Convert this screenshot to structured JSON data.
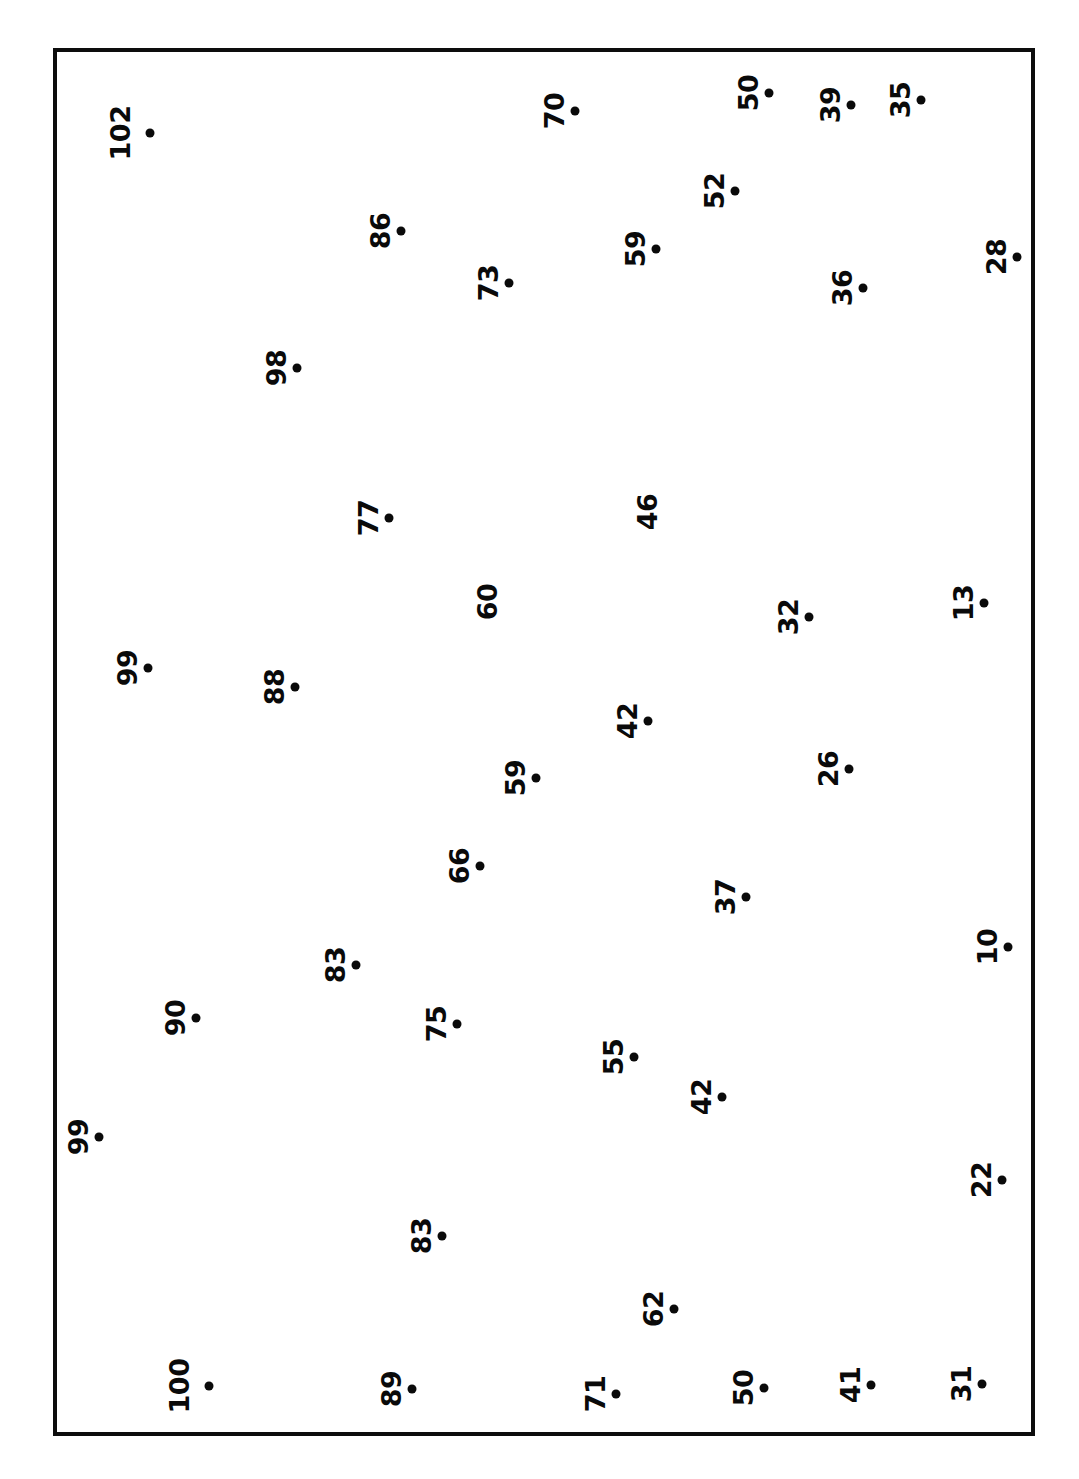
{
  "figure": {
    "kind": "scatter-plot",
    "background_color": "#ffffff",
    "frame_color": "#0d0d0d",
    "marker_color": "#0a0a0a",
    "label_color": "#0a0a0a",
    "label_rotation_deg": -90
  },
  "chart_data": {
    "type": "scatter",
    "title": "",
    "xlabel": "",
    "ylabel": "",
    "grid": false,
    "legend": null,
    "axis_ticks": [],
    "axis_tick_labels": [],
    "xlim": [
      53,
      1035
    ],
    "ylim": [
      48,
      1436
    ],
    "point_label_orientation": "rotated 90 degrees counter-clockwise, placed to the left of each marker",
    "note": "Each marker is annotated with a numeric value. Two annotations (60 and 46) appear without a visible marker dot.",
    "labels": [
      102,
      70,
      50,
      39,
      35,
      86,
      52,
      59,
      73,
      36,
      28,
      98,
      77,
      46,
      60,
      32,
      13,
      99,
      88,
      42,
      59,
      26,
      66,
      37,
      83,
      10,
      90,
      75,
      55,
      42,
      99,
      22,
      83,
      62,
      100,
      89,
      71,
      50,
      41,
      31
    ],
    "points": [
      {
        "label": "102",
        "x": 150,
        "y": 133,
        "marker": true
      },
      {
        "label": "70",
        "x": 575,
        "y": 111,
        "marker": true
      },
      {
        "label": "50",
        "x": 769,
        "y": 93,
        "marker": true
      },
      {
        "label": "39",
        "x": 851,
        "y": 105,
        "marker": true
      },
      {
        "label": "35",
        "x": 921,
        "y": 100,
        "marker": true
      },
      {
        "label": "86",
        "x": 401,
        "y": 231,
        "marker": true
      },
      {
        "label": "52",
        "x": 735,
        "y": 191,
        "marker": true
      },
      {
        "label": "59",
        "x": 656,
        "y": 249,
        "marker": true
      },
      {
        "label": "73",
        "x": 509,
        "y": 283,
        "marker": true
      },
      {
        "label": "36",
        "x": 863,
        "y": 288,
        "marker": true
      },
      {
        "label": "28",
        "x": 1017,
        "y": 257,
        "marker": true
      },
      {
        "label": "98",
        "x": 297,
        "y": 368,
        "marker": true
      },
      {
        "label": "77",
        "x": 389,
        "y": 518,
        "marker": true
      },
      {
        "label": "46",
        "x": 668,
        "y": 512,
        "marker": false
      },
      {
        "label": "60",
        "x": 508,
        "y": 602,
        "marker": false
      },
      {
        "label": "32",
        "x": 809,
        "y": 617,
        "marker": true
      },
      {
        "label": "13",
        "x": 984,
        "y": 603,
        "marker": true
      },
      {
        "label": "99",
        "x": 148,
        "y": 668,
        "marker": true
      },
      {
        "label": "88",
        "x": 295,
        "y": 687,
        "marker": true
      },
      {
        "label": "42",
        "x": 648,
        "y": 721,
        "marker": true
      },
      {
        "label": "59",
        "x": 536,
        "y": 778,
        "marker": true
      },
      {
        "label": "26",
        "x": 849,
        "y": 769,
        "marker": true
      },
      {
        "label": "66",
        "x": 480,
        "y": 866,
        "marker": true
      },
      {
        "label": "37",
        "x": 746,
        "y": 897,
        "marker": true
      },
      {
        "label": "83",
        "x": 356,
        "y": 965,
        "marker": true
      },
      {
        "label": "10",
        "x": 1008,
        "y": 947,
        "marker": true
      },
      {
        "label": "90",
        "x": 196,
        "y": 1018,
        "marker": true
      },
      {
        "label": "75",
        "x": 457,
        "y": 1024,
        "marker": true
      },
      {
        "label": "55",
        "x": 634,
        "y": 1057,
        "marker": true
      },
      {
        "label": "42",
        "x": 722,
        "y": 1097,
        "marker": true
      },
      {
        "label": "99",
        "x": 99,
        "y": 1137,
        "marker": true
      },
      {
        "label": "22",
        "x": 1002,
        "y": 1180,
        "marker": true
      },
      {
        "label": "83",
        "x": 442,
        "y": 1236,
        "marker": true
      },
      {
        "label": "62",
        "x": 674,
        "y": 1309,
        "marker": true
      },
      {
        "label": "100",
        "x": 209,
        "y": 1386,
        "marker": true
      },
      {
        "label": "89",
        "x": 412,
        "y": 1389,
        "marker": true
      },
      {
        "label": "71",
        "x": 616,
        "y": 1394,
        "marker": true
      },
      {
        "label": "50",
        "x": 764,
        "y": 1388,
        "marker": true
      },
      {
        "label": "41",
        "x": 871,
        "y": 1385,
        "marker": true
      },
      {
        "label": "31",
        "x": 982,
        "y": 1384,
        "marker": true
      }
    ]
  }
}
